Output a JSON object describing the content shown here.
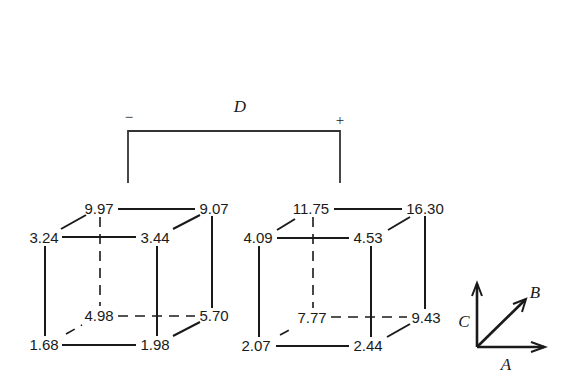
{
  "diagram": {
    "contrast": {
      "label": "D",
      "minus_sign": "−",
      "plus_sign": "+"
    },
    "cubes": [
      {
        "name": "D-minus",
        "vertices": {
          "front_top_left": "3.24",
          "front_top_right": "3.44",
          "back_top_left": "9.97",
          "back_top_right": "9.07",
          "front_bottom_left": "1.68",
          "front_bottom_right": "1.98",
          "back_bottom_left": "4.98",
          "back_bottom_right": "5.70"
        }
      },
      {
        "name": "D-plus",
        "vertices": {
          "front_top_left": "4.09",
          "front_top_right": "4.53",
          "back_top_left": "11.75",
          "back_top_right": "16.30",
          "front_bottom_left": "2.07",
          "front_bottom_right": "2.44",
          "back_bottom_left": "7.77",
          "back_bottom_right": "9.43"
        }
      }
    ],
    "axes": {
      "horizontal": "A",
      "depth": "B",
      "vertical": "C"
    }
  }
}
